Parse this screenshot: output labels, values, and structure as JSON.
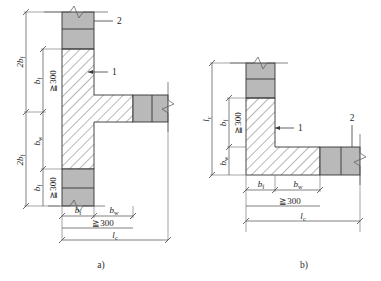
{
  "figure": {
    "background_color": "#ffffff",
    "line_color": "#333333",
    "hatch_fill_color": "#ffffff",
    "grey_fill_color": "#b9b9b9",
    "dimension_line_color": "#4a4a4a"
  },
  "subfigures": [
    {
      "id": "a",
      "caption": "a)",
      "shape": "T-shaped wall column junction",
      "callouts": [
        {
          "id": "callout-1",
          "number": "1",
          "target": "hatched core region"
        },
        {
          "id": "callout-2",
          "number": "2",
          "target": "grey flange region at top"
        }
      ],
      "vertical_dimensions": [
        {
          "id": "dim-2bf-top",
          "label": "2b",
          "sub": "f"
        },
        {
          "id": "dim-bf-top",
          "label": "b",
          "sub": "f"
        },
        {
          "id": "dim-min300-top",
          "label": "≧300",
          "sub": ""
        },
        {
          "id": "dim-bw",
          "label": "b",
          "sub": "w"
        },
        {
          "id": "dim-bf-bottom",
          "label": "b",
          "sub": "f"
        },
        {
          "id": "dim-min300-bottom",
          "label": "≧300",
          "sub": ""
        },
        {
          "id": "dim-2bf-bottom",
          "label": "2b",
          "sub": "f"
        }
      ],
      "horizontal_dimensions": [
        {
          "id": "dim-bf-horiz",
          "label": "b",
          "sub": "f"
        },
        {
          "id": "dim-bw-horiz",
          "label": "b",
          "sub": "w"
        },
        {
          "id": "dim-min300-horiz",
          "label": "≧300",
          "sub": ""
        },
        {
          "id": "dim-lc-horiz",
          "label": "l",
          "sub": "c"
        }
      ]
    },
    {
      "id": "b",
      "caption": "b)",
      "shape": "L-shaped wall column corner",
      "callouts": [
        {
          "id": "callout-1",
          "number": "1",
          "target": "hatched core region"
        },
        {
          "id": "callout-2",
          "number": "2",
          "target": "grey flange region at right"
        }
      ],
      "vertical_dimensions": [
        {
          "id": "dim-lc-vert",
          "label": "l",
          "sub": "c"
        },
        {
          "id": "dim-bf-vert",
          "label": "b",
          "sub": "f"
        },
        {
          "id": "dim-min300-vert",
          "label": "≧300",
          "sub": ""
        },
        {
          "id": "dim-bw-vert",
          "label": "b",
          "sub": "w"
        }
      ],
      "horizontal_dimensions": [
        {
          "id": "dim-bf-horiz",
          "label": "b",
          "sub": "f"
        },
        {
          "id": "dim-bw-horiz",
          "label": "b",
          "sub": "w"
        },
        {
          "id": "dim-min300-horiz",
          "label": "≧300",
          "sub": ""
        },
        {
          "id": "dim-lc-horiz",
          "label": "l",
          "sub": "c"
        }
      ]
    }
  ]
}
